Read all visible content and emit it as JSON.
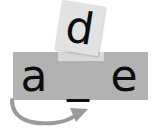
{
  "diagram": {
    "bar": {
      "slots": [
        {
          "label": "a",
          "filled": true
        },
        {
          "label": "_",
          "filled": false
        },
        {
          "label": "e",
          "filled": true
        }
      ]
    },
    "floating_tile": {
      "label": "d",
      "rotation_deg": 9
    },
    "arrow": {
      "label": "curved-move-arrow",
      "direction": "left-to-right"
    },
    "colors": {
      "bar": "#b2b2b2",
      "bar_gap": "#d9d9d9",
      "tile": "#e2e2e2",
      "letter": "#0d0d0d",
      "arrow": "#9a9a9a",
      "background": "#ffffff"
    }
  }
}
